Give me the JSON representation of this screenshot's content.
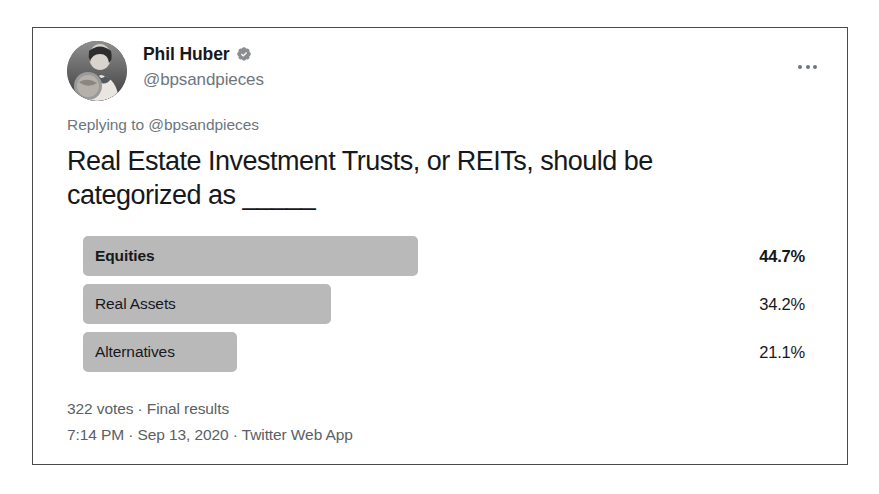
{
  "card": {
    "border_color": "#4a4a4a",
    "background": "#ffffff"
  },
  "author": {
    "display_name": "Phil Huber",
    "handle": "@bpsandpieces",
    "verified": true,
    "verified_badge_color": "#8b8d90",
    "avatar_alt": "profile-photo"
  },
  "actions": {
    "more_label": "More"
  },
  "reply_context": {
    "text": "Replying to @bpsandpieces"
  },
  "tweet": {
    "text": "Real Estate Investment Trusts, or REITs, should be categorized as _____"
  },
  "poll": {
    "bar_color": "#b9b9b9",
    "options": [
      {
        "label": "Equities",
        "percent": "44.7%",
        "value": 44.7,
        "width_px": 335,
        "winner": true
      },
      {
        "label": "Real Assets",
        "percent": "34.2%",
        "value": 34.2,
        "width_px": 248,
        "winner": false
      },
      {
        "label": "Alternatives",
        "percent": "21.1%",
        "value": 21.1,
        "width_px": 154,
        "winner": false
      }
    ],
    "meta": "322 votes · Final results",
    "votes_count": "322 votes",
    "status": "Final results"
  },
  "footer": {
    "meta": "7:14 PM · Sep 13, 2020 · Twitter Web App",
    "time": "7:14 PM",
    "date": "Sep 13, 2020",
    "source": "Twitter Web App"
  }
}
